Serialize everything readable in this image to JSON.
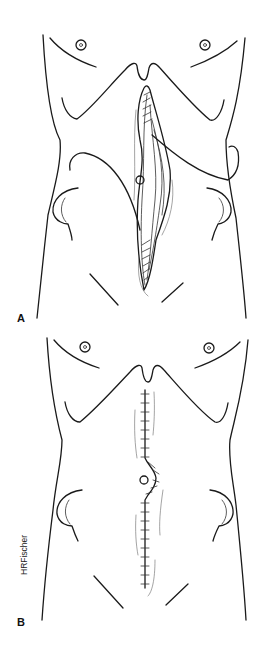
{
  "figure": {
    "panels": [
      {
        "label": "A",
        "description": "Abdominal torso with open midline wound, sutured ends and retracted tissue layers"
      },
      {
        "label": "B",
        "description": "Abdominal torso with closed midline incision, interrupted sutures curving around umbilicus"
      }
    ],
    "signature": "HRFischer",
    "line_color": "#1a1a1a",
    "background": "#ffffff"
  }
}
